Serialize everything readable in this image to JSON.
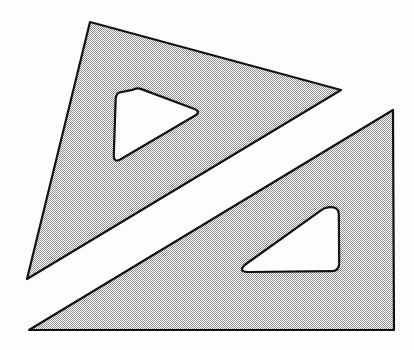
{
  "figure": {
    "title": "Two Overlapping Set Squares (Drafting Triangles)",
    "type": "line-drawing",
    "canvas": {
      "width": 414,
      "height": 350,
      "background": "#fdfdfd"
    },
    "style": {
      "outline_color": "#111111",
      "outline_width": 2.2,
      "fill_pattern": "50% dither stipple",
      "fill_base_color": "#c9c9c9",
      "fill_dot_color": "#8a8a8a",
      "hole_fill": "#ffffff"
    },
    "shapes": [
      {
        "name": "upper-left-triangle",
        "label": "Upper-left set square",
        "outline_points": "90,22 341,90 27,279",
        "orientation": "apex top-left, hypotenuse running top-left to bottom-right",
        "hole": {
          "name": "upper-triangle-hole",
          "label": "Rounded triangular cut-out",
          "points": "137,89 198,112 115,157",
          "corner_radius": 9
        }
      },
      {
        "name": "lower-right-triangle",
        "label": "Lower-right set square",
        "outline_points": "393,110 394,330 29,330",
        "orientation": "right angle at bottom-right, hypotenuse running top-right to bottom-left",
        "hole": {
          "name": "lower-triangle-hole",
          "label": "Rounded triangular cut-out",
          "points": "337,209 339,270 241,271",
          "corner_radius": 11
        }
      }
    ],
    "gap": {
      "name": "white-separation-band",
      "label": "White gap between the two triangles",
      "color": "#ffffff"
    }
  }
}
